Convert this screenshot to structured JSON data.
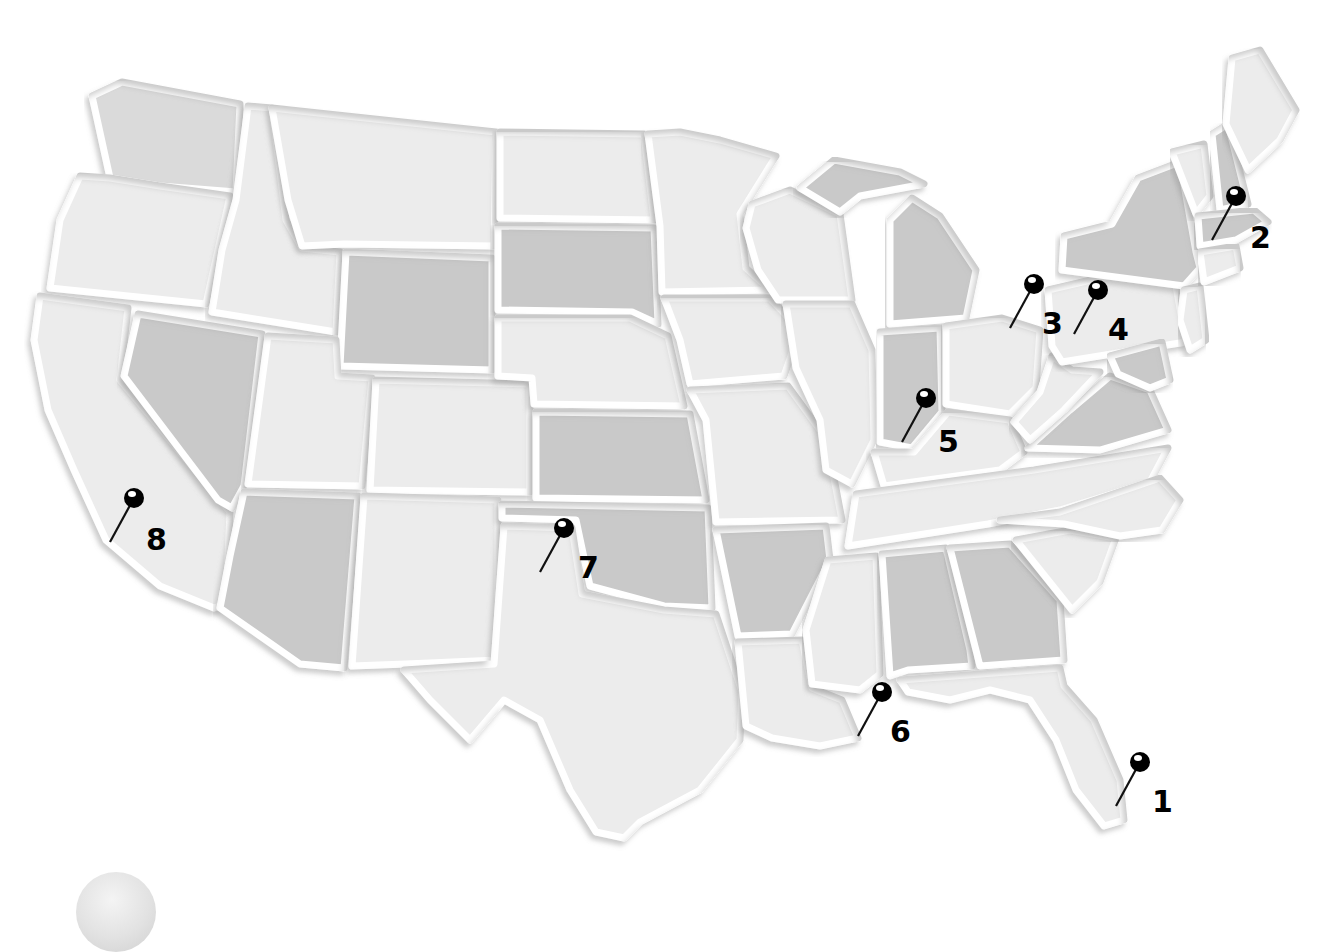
{
  "map": {
    "type": "us-states-grayscale-emboss",
    "colors": {
      "background": "#ffffff",
      "state_light": "#ececec",
      "state_mid": "#dadada",
      "state_dark": "#c9c9c9",
      "border": "#ffffff",
      "pin": "#000000"
    }
  },
  "pins": [
    {
      "number": "1",
      "x": 1140,
      "y": 762,
      "label_x": 1152,
      "label_y": 812
    },
    {
      "number": "2",
      "x": 1236,
      "y": 196,
      "label_x": 1250,
      "label_y": 248
    },
    {
      "number": "3",
      "x": 1034,
      "y": 284,
      "label_x": 1042,
      "label_y": 334
    },
    {
      "number": "4",
      "x": 1098,
      "y": 290,
      "label_x": 1108,
      "label_y": 340
    },
    {
      "number": "5",
      "x": 926,
      "y": 398,
      "label_x": 938,
      "label_y": 452
    },
    {
      "number": "6",
      "x": 882,
      "y": 692,
      "label_x": 890,
      "label_y": 742
    },
    {
      "number": "7",
      "x": 564,
      "y": 528,
      "label_x": 578,
      "label_y": 578
    },
    {
      "number": "8",
      "x": 134,
      "y": 498,
      "label_x": 146,
      "label_y": 550
    }
  ]
}
